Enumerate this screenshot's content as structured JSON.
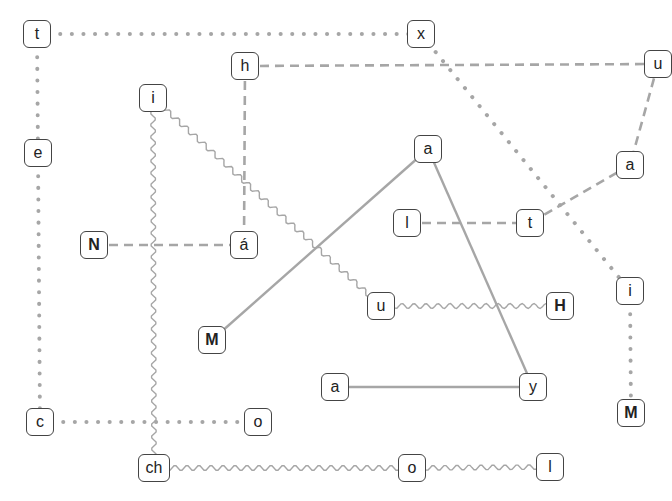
{
  "diagram": {
    "edge_color": "#a6a6a6",
    "nodes": [
      {
        "id": "t1",
        "label": "t",
        "x": 37,
        "y": 34,
        "bold": false
      },
      {
        "id": "x",
        "label": "x",
        "x": 421,
        "y": 34,
        "bold": false
      },
      {
        "id": "h",
        "label": "h",
        "x": 245,
        "y": 66,
        "bold": false
      },
      {
        "id": "u1",
        "label": "u",
        "x": 658,
        "y": 64,
        "bold": false
      },
      {
        "id": "i1",
        "label": "i",
        "x": 153,
        "y": 98,
        "bold": false
      },
      {
        "id": "e",
        "label": "e",
        "x": 38,
        "y": 153,
        "bold": false
      },
      {
        "id": "a1",
        "label": "a",
        "x": 428,
        "y": 149,
        "bold": false
      },
      {
        "id": "a2",
        "label": "a",
        "x": 630,
        "y": 165,
        "bold": false
      },
      {
        "id": "l1",
        "label": "l",
        "x": 407,
        "y": 223,
        "bold": false
      },
      {
        "id": "t2",
        "label": "t",
        "x": 530,
        "y": 223,
        "bold": false
      },
      {
        "id": "N",
        "label": "N",
        "x": 94,
        "y": 245,
        "bold": true
      },
      {
        "id": "aacute",
        "label": "á",
        "x": 244,
        "y": 245,
        "bold": false
      },
      {
        "id": "u2",
        "label": "u",
        "x": 381,
        "y": 306,
        "bold": false
      },
      {
        "id": "H",
        "label": "H",
        "x": 560,
        "y": 306,
        "bold": true
      },
      {
        "id": "i2",
        "label": "i",
        "x": 630,
        "y": 291,
        "bold": false
      },
      {
        "id": "M1",
        "label": "M",
        "x": 212,
        "y": 340,
        "bold": true
      },
      {
        "id": "a3",
        "label": "a",
        "x": 335,
        "y": 387,
        "bold": false
      },
      {
        "id": "y",
        "label": "y",
        "x": 533,
        "y": 387,
        "bold": false
      },
      {
        "id": "M2",
        "label": "M",
        "x": 631,
        "y": 413,
        "bold": true
      },
      {
        "id": "c",
        "label": "c",
        "x": 40,
        "y": 422,
        "bold": false
      },
      {
        "id": "o1",
        "label": "o",
        "x": 258,
        "y": 422,
        "bold": false
      },
      {
        "id": "ch",
        "label": "ch",
        "x": 154,
        "y": 468,
        "bold": false
      },
      {
        "id": "o2",
        "label": "o",
        "x": 412,
        "y": 468,
        "bold": false
      },
      {
        "id": "l2",
        "label": "l",
        "x": 550,
        "y": 467,
        "bold": false
      }
    ],
    "edges": [
      {
        "from": "t1",
        "to": "x",
        "style": "dotted"
      },
      {
        "from": "t1",
        "to": "e",
        "style": "dotted"
      },
      {
        "from": "e",
        "to": "c",
        "style": "dotted"
      },
      {
        "from": "c",
        "to": "o1",
        "style": "dotted"
      },
      {
        "from": "x",
        "to": "i2",
        "style": "dotted"
      },
      {
        "from": "i2",
        "to": "M2",
        "style": "dotted"
      },
      {
        "from": "h",
        "to": "u1",
        "style": "dashed"
      },
      {
        "from": "h",
        "to": "aacute",
        "style": "dashed"
      },
      {
        "from": "N",
        "to": "aacute",
        "style": "dashed"
      },
      {
        "from": "u1",
        "to": "a2",
        "style": "dashed"
      },
      {
        "from": "a2",
        "to": "t2",
        "style": "dashed"
      },
      {
        "from": "l1",
        "to": "t2",
        "style": "dashed"
      },
      {
        "from": "i1",
        "to": "u2",
        "style": "wavy"
      },
      {
        "from": "i1",
        "to": "ch",
        "style": "wavy"
      },
      {
        "from": "u2",
        "to": "H",
        "style": "wavy"
      },
      {
        "from": "ch",
        "to": "o2",
        "style": "wavy"
      },
      {
        "from": "o2",
        "to": "l2",
        "style": "wavy"
      },
      {
        "from": "a1",
        "to": "M1",
        "style": "solid"
      },
      {
        "from": "a1",
        "to": "y",
        "style": "solid"
      },
      {
        "from": "a3",
        "to": "y",
        "style": "solid"
      }
    ]
  }
}
